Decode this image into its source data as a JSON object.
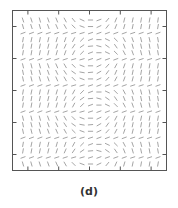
{
  "chart_data": {
    "type": "vector-field",
    "title": "",
    "xlabel": "",
    "ylabel": "",
    "caption": "(d)",
    "grid": {
      "columns": 17,
      "rows": 23
    },
    "xlim": [
      0,
      1
    ],
    "ylim": [
      0,
      1
    ],
    "x_ticks": [
      0.1,
      0.3,
      0.5,
      0.7,
      0.9
    ],
    "y_ticks": [
      0.1,
      0.3,
      0.5,
      0.7,
      0.9
    ],
    "tick_labels_shown": false,
    "segment_color": "#9a9a9a",
    "frame_color": "#555555",
    "angle_units": "degrees from vertical, positive = tilted toward upper-right",
    "row_band_period": 4,
    "angles": [
      [
        -18,
        -18,
        -16,
        -20,
        -22,
        -28,
        -40,
        -65,
        -90,
        70,
        40,
        22,
        14,
        12,
        10,
        10,
        8
      ],
      [
        -16,
        -18,
        -16,
        -20,
        -24,
        -30,
        -45,
        -70,
        -90,
        65,
        38,
        22,
        16,
        12,
        10,
        10,
        10
      ],
      [
        70,
        70,
        70,
        72,
        72,
        72,
        74,
        74,
        72,
        70,
        70,
        70,
        70,
        72,
        72,
        72,
        70
      ],
      [
        10,
        12,
        12,
        14,
        16,
        20,
        28,
        45,
        70,
        -90,
        -65,
        -45,
        -28,
        -20,
        -14,
        -12,
        -10
      ],
      [
        10,
        10,
        12,
        14,
        18,
        24,
        34,
        55,
        85,
        -75,
        -55,
        -35,
        -22,
        -16,
        -12,
        -10,
        -10
      ],
      [
        10,
        10,
        12,
        14,
        16,
        20,
        28,
        45,
        70,
        -90,
        -65,
        -45,
        -28,
        -20,
        -14,
        -12,
        -10
      ],
      [
        70,
        70,
        70,
        72,
        72,
        72,
        74,
        74,
        72,
        70,
        70,
        70,
        70,
        72,
        72,
        72,
        70
      ],
      [
        -14,
        -14,
        -16,
        -20,
        -24,
        -30,
        -45,
        -70,
        -90,
        65,
        42,
        28,
        20,
        14,
        12,
        10,
        10
      ],
      [
        -12,
        -14,
        -16,
        -20,
        -26,
        -34,
        -55,
        -80,
        85,
        60,
        36,
        24,
        16,
        12,
        10,
        10,
        10
      ],
      [
        -12,
        -14,
        -16,
        -20,
        -24,
        -30,
        -45,
        -70,
        -90,
        65,
        42,
        28,
        20,
        14,
        12,
        10,
        10
      ],
      [
        70,
        70,
        70,
        72,
        72,
        72,
        74,
        74,
        72,
        70,
        70,
        70,
        70,
        72,
        72,
        72,
        70
      ],
      [
        10,
        12,
        12,
        14,
        16,
        20,
        28,
        45,
        70,
        -90,
        -65,
        -45,
        -28,
        -20,
        -14,
        -12,
        -10
      ],
      [
        10,
        10,
        12,
        14,
        18,
        24,
        34,
        55,
        85,
        -75,
        -55,
        -35,
        -22,
        -16,
        -12,
        -10,
        -10
      ],
      [
        10,
        10,
        12,
        14,
        16,
        20,
        28,
        45,
        70,
        -90,
        -65,
        -45,
        -28,
        -20,
        -14,
        -12,
        -10
      ],
      [
        70,
        70,
        70,
        72,
        72,
        72,
        74,
        74,
        72,
        70,
        70,
        70,
        70,
        72,
        72,
        72,
        70
      ],
      [
        -14,
        -14,
        -16,
        -20,
        -24,
        -30,
        -45,
        -70,
        -90,
        65,
        42,
        28,
        20,
        14,
        12,
        10,
        10
      ],
      [
        -12,
        -14,
        -16,
        -20,
        -26,
        -34,
        -55,
        -80,
        85,
        60,
        36,
        24,
        16,
        12,
        10,
        10,
        10
      ],
      [
        -12,
        -14,
        -16,
        -20,
        -24,
        -30,
        -45,
        -70,
        -90,
        65,
        42,
        28,
        20,
        14,
        12,
        10,
        10
      ],
      [
        70,
        70,
        70,
        72,
        72,
        72,
        74,
        74,
        72,
        70,
        70,
        70,
        70,
        72,
        72,
        72,
        70
      ],
      [
        10,
        12,
        12,
        14,
        16,
        20,
        28,
        45,
        70,
        -90,
        -65,
        -45,
        -28,
        -20,
        -14,
        -12,
        -10
      ],
      [
        10,
        10,
        12,
        14,
        18,
        24,
        34,
        55,
        85,
        -75,
        -55,
        -35,
        -22,
        -16,
        -12,
        -10,
        -10
      ],
      [
        70,
        70,
        70,
        72,
        72,
        72,
        74,
        74,
        72,
        70,
        70,
        70,
        70,
        72,
        72,
        72,
        70
      ],
      [
        -16,
        -16,
        -18,
        -20,
        -24,
        -30,
        -45,
        -70,
        -90,
        65,
        40,
        24,
        16,
        12,
        10,
        10,
        10
      ]
    ]
  }
}
